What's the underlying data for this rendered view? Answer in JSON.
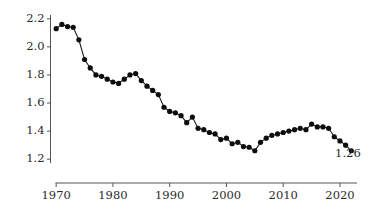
{
  "chart_data": {
    "type": "line",
    "title": "",
    "subtitle": "",
    "xlabel": "",
    "ylabel": "",
    "xlim": [
      1969,
      2023
    ],
    "ylim": [
      1.18,
      2.22
    ],
    "grid": false,
    "legend": null,
    "marker": "filled-circle",
    "series_color": "#0d0d0d",
    "x_ticks": [
      "1970",
      "1980",
      "1990",
      "2000",
      "2010",
      "2020"
    ],
    "x_tick_values": [
      1970,
      1980,
      1990,
      2000,
      2010,
      2020
    ],
    "y_ticks": [
      "2.2",
      "2.0",
      "1.8",
      "1.6",
      "1.4",
      "1.2"
    ],
    "y_tick_values": [
      2.2,
      2.0,
      1.8,
      1.6,
      1.4,
      1.2
    ],
    "annotations": [
      {
        "text": "1.26",
        "x": 2021.4,
        "y": 1.215
      }
    ],
    "x": [
      1970,
      1971,
      1972,
      1973,
      1974,
      1975,
      1976,
      1977,
      1978,
      1979,
      1980,
      1981,
      1982,
      1983,
      1984,
      1985,
      1986,
      1987,
      1988,
      1989,
      1990,
      1991,
      1992,
      1993,
      1994,
      1995,
      1996,
      1997,
      1998,
      1999,
      2000,
      2001,
      2002,
      2003,
      2004,
      2005,
      2006,
      2007,
      2008,
      2009,
      2010,
      2011,
      2012,
      2013,
      2014,
      2015,
      2016,
      2017,
      2018,
      2019,
      2020,
      2021,
      2022
    ],
    "values": [
      2.13,
      2.16,
      2.145,
      2.14,
      2.05,
      1.91,
      1.85,
      1.8,
      1.79,
      1.77,
      1.75,
      1.74,
      1.77,
      1.8,
      1.81,
      1.76,
      1.72,
      1.69,
      1.66,
      1.57,
      1.54,
      1.53,
      1.51,
      1.46,
      1.5,
      1.42,
      1.41,
      1.39,
      1.38,
      1.34,
      1.35,
      1.31,
      1.32,
      1.29,
      1.285,
      1.26,
      1.32,
      1.35,
      1.37,
      1.38,
      1.39,
      1.4,
      1.41,
      1.42,
      1.41,
      1.45,
      1.43,
      1.43,
      1.42,
      1.36,
      1.33,
      1.3,
      1.26
    ]
  }
}
